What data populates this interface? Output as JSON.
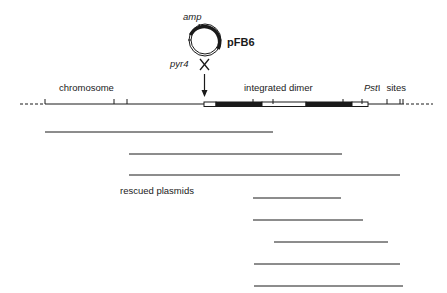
{
  "plasmid": {
    "name": "pFB6",
    "marker_top": "amp",
    "marker_bottom": "pyr4"
  },
  "labels": {
    "chromosome": "chromosome",
    "integrated": "integrated dimer",
    "pst_italic": "Pst",
    "pst_roman": "I",
    "sites": "sites",
    "rescued": "rescued plasmids"
  },
  "colors": {
    "ink": "#1a1a1a",
    "background": "#ffffff"
  },
  "map": {
    "segments": [
      "plasmid-white",
      "plasmid-black",
      "plasmid-white",
      "plasmid-black",
      "plasmid-white"
    ],
    "pst_site_count": 10
  },
  "rescued_plasmid_count": 7
}
